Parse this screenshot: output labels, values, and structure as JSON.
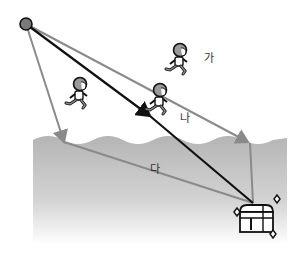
{
  "diagram": {
    "start_point": {
      "x": 26,
      "y": 24
    },
    "paths": [
      {
        "id": "ga",
        "label": "가",
        "color": "#8a8a8a",
        "points": [
          [
            26,
            24
          ],
          [
            250,
            143
          ],
          [
            253,
            205
          ]
        ]
      },
      {
        "id": "na",
        "label": "나",
        "color": "#111111",
        "points": [
          [
            26,
            24
          ],
          [
            253,
            205
          ]
        ]
      },
      {
        "id": "da",
        "label": "다",
        "color": "#8a8a8a",
        "points": [
          [
            26,
            24
          ],
          [
            64,
            142
          ],
          [
            253,
            205
          ]
        ]
      }
    ],
    "labels": {
      "ga": "가",
      "na": "나",
      "da": "다"
    },
    "water": {
      "top": 140,
      "bottom": 245,
      "left": 33,
      "right": 287,
      "color": "#b8b8b8"
    },
    "treasure": {
      "x": 255,
      "y": 215
    },
    "runners": [
      {
        "x": 78,
        "y": 95
      },
      {
        "x": 158,
        "y": 100
      },
      {
        "x": 178,
        "y": 62
      }
    ]
  }
}
